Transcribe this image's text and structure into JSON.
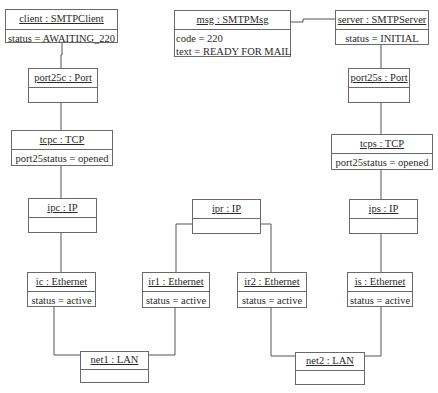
{
  "diagram": {
    "type": "UML object diagram",
    "objects": {
      "client": {
        "name": "client : SMTPClient",
        "attrs": [
          "status = AWAITING_220"
        ]
      },
      "msg": {
        "name": "msg : SMTPMsg",
        "attrs": [
          "code = 220",
          "text = READY FOR MAIL"
        ]
      },
      "server": {
        "name": "server : SMTPServer",
        "attrs": [
          "status = INITIAL"
        ]
      },
      "port25c": {
        "name": "port25c : Port",
        "attrs": []
      },
      "port25s": {
        "name": "port25s : Port",
        "attrs": []
      },
      "tcpc": {
        "name": "tcpc : TCP",
        "attrs": [
          "port25status = opened"
        ]
      },
      "tcps": {
        "name": "tcps : TCP",
        "attrs": [
          "port25status = opened"
        ]
      },
      "ipc": {
        "name": "ipc : IP",
        "attrs": []
      },
      "ipr": {
        "name": "ipr : IP",
        "attrs": []
      },
      "ips": {
        "name": "ips : IP",
        "attrs": []
      },
      "ic": {
        "name": "ic : Ethernet",
        "attrs": [
          "status = active"
        ]
      },
      "ir1": {
        "name": "ir1 : Ethernet",
        "attrs": [
          "status = active"
        ]
      },
      "ir2": {
        "name": "ir2 : Ethernet",
        "attrs": [
          "status = active"
        ]
      },
      "is": {
        "name": "is : Ethernet",
        "attrs": [
          "status = active"
        ]
      },
      "net1": {
        "name": "net1 : LAN",
        "attrs": []
      },
      "net2": {
        "name": "net2 : LAN",
        "attrs": []
      }
    },
    "links": [
      [
        "client",
        "port25c"
      ],
      [
        "port25c",
        "tcpc"
      ],
      [
        "tcpc",
        "ipc"
      ],
      [
        "ipc",
        "ic"
      ],
      [
        "ic",
        "net1"
      ],
      [
        "msg",
        "server"
      ],
      [
        "server",
        "port25s"
      ],
      [
        "port25s",
        "tcps"
      ],
      [
        "tcps",
        "ips"
      ],
      [
        "ips",
        "is"
      ],
      [
        "is",
        "net2"
      ],
      [
        "ipr",
        "ir1"
      ],
      [
        "ipr",
        "ir2"
      ],
      [
        "ir1",
        "net1"
      ],
      [
        "ir2",
        "net2"
      ]
    ]
  }
}
